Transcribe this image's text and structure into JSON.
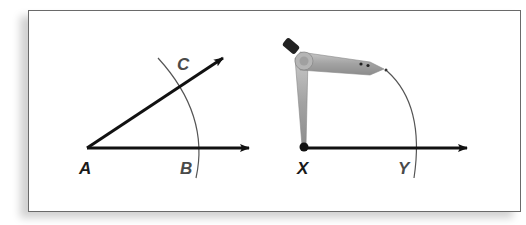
{
  "figure": {
    "left_panel": {
      "description": "Angle with vertex A and arc intersecting rays at B and C",
      "labels": {
        "vertex": "A",
        "lower_point": "B",
        "upper_point": "C"
      }
    },
    "right_panel": {
      "description": "Compass with point on X drawing an arc through Y",
      "labels": {
        "vertex": "X",
        "arc_point": "Y"
      },
      "tool": "compass-icon"
    },
    "colors": {
      "ray": "#111111",
      "arc": "#555555",
      "label_vertex": "#1a1a1a",
      "label_point": "#4a4a4a",
      "compass_body": "#a9a9a9",
      "compass_knob": "#222222"
    }
  }
}
